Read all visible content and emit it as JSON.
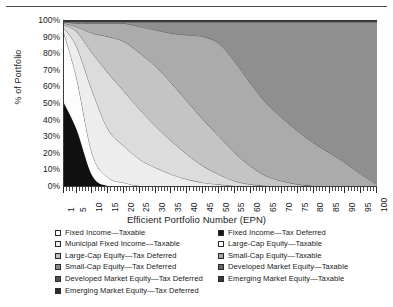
{
  "chart_data": {
    "type": "area",
    "stacked": true,
    "title": "",
    "xlabel": "Efficient Portfolio Number (EPN)",
    "ylabel": "% of Portfolio",
    "xlim": [
      1,
      100
    ],
    "ylim": [
      0,
      100
    ],
    "grid": false,
    "legend_position": "bottom",
    "y_ticks": [
      "0%",
      "10%",
      "20%",
      "30%",
      "40%",
      "50%",
      "60%",
      "70%",
      "80%",
      "90%",
      "100%"
    ],
    "y_tick_values": [
      0,
      10,
      20,
      30,
      40,
      50,
      60,
      70,
      80,
      90,
      100
    ],
    "x_ticks": [
      "1",
      "5",
      "10",
      "15",
      "20",
      "25",
      "30",
      "35",
      "40",
      "45",
      "50",
      "55",
      "60",
      "65",
      "70",
      "75",
      "80",
      "85",
      "90",
      "95",
      "100"
    ],
    "x_tick_values": [
      1,
      5,
      10,
      15,
      20,
      25,
      30,
      35,
      40,
      45,
      50,
      55,
      60,
      65,
      70,
      75,
      80,
      85,
      90,
      95,
      100
    ],
    "x": [
      1,
      5,
      10,
      15,
      20,
      25,
      30,
      35,
      40,
      45,
      50,
      55,
      60,
      65,
      70,
      75,
      80,
      85,
      90,
      95,
      100
    ],
    "series": [
      {
        "name": "Fixed Income—Tax Deferred",
        "color": "#111111",
        "values": [
          50,
          34,
          6,
          0,
          0,
          0,
          0,
          0,
          0,
          0,
          0,
          0,
          0,
          0,
          0,
          0,
          0,
          0,
          0,
          0,
          0
        ]
      },
      {
        "name": "Fixed Income—Taxable",
        "color": "#fdfdfd",
        "values": [
          42,
          31,
          13,
          5,
          2,
          0,
          0,
          0,
          0,
          0,
          0,
          0,
          0,
          0,
          0,
          0,
          0,
          0,
          0,
          0,
          0
        ]
      },
      {
        "name": "Municipal Fixed Income—Taxable",
        "color": "#ededed",
        "values": [
          3,
          19,
          38,
          29,
          22,
          16,
          11,
          7,
          4,
          2,
          1,
          0,
          0,
          0,
          0,
          0,
          0,
          0,
          0,
          0,
          0
        ]
      },
      {
        "name": "Large-Cap Equity—Taxable",
        "color": "#dcdcdc",
        "values": [
          2,
          9,
          23,
          34,
          33,
          30,
          25,
          20,
          15,
          10,
          6,
          3,
          1,
          0,
          0,
          0,
          0,
          0,
          0,
          0,
          0
        ]
      },
      {
        "name": "Large-Cap Equity—Tax Deferred",
        "color": "#c4c4c4",
        "values": [
          1,
          3,
          12,
          22,
          30,
          34,
          36,
          35,
          32,
          28,
          23,
          17,
          11,
          6,
          3,
          1,
          0,
          0,
          0,
          0,
          0
        ]
      },
      {
        "name": "Small-Cap Equity—Taxable",
        "color": "#ababab",
        "values": [
          1,
          2,
          6,
          8,
          11,
          16,
          22,
          30,
          40,
          50,
          56,
          55,
          50,
          44,
          38,
          32,
          26,
          20,
          14,
          7,
          1
        ]
      },
      {
        "name": "Small-Cap Equity—Tax Deferred",
        "color": "#8f8f8f",
        "values": [
          0,
          1,
          1,
          1,
          1,
          3,
          5,
          7,
          8,
          9,
          13,
          24,
          37,
          49,
          58,
          66,
          73,
          79,
          85,
          92,
          98
        ]
      },
      {
        "name": "Developed Market Equity—Taxable",
        "color": "#6e6e6e",
        "values": [
          0,
          0,
          0,
          0,
          0,
          0,
          0,
          0,
          0,
          0,
          0,
          0,
          0,
          0,
          0,
          0,
          0,
          0,
          0,
          0,
          0
        ]
      },
      {
        "name": "Developed Market Equity—Tax Deferred",
        "color": "#565656",
        "values": [
          0,
          0,
          0,
          0,
          0,
          0,
          0,
          0,
          0,
          0,
          0,
          0,
          0,
          0,
          0,
          0,
          0,
          0,
          0,
          0,
          0
        ]
      },
      {
        "name": "Emerging Market Equity—Taxable",
        "color": "#3d3d3d",
        "values": [
          1,
          1,
          1,
          1,
          1,
          1,
          1,
          1,
          1,
          1,
          1,
          1,
          1,
          1,
          1,
          1,
          1,
          1,
          1,
          1,
          1
        ]
      },
      {
        "name": "Emerging Market Equity—Tax Deferred",
        "color": "#2a2a2a",
        "values": [
          0,
          0,
          0,
          0,
          0,
          0,
          0,
          0,
          0,
          0,
          0,
          0,
          0,
          0,
          0,
          0,
          0,
          0,
          0,
          0,
          0
        ]
      }
    ]
  },
  "axes": {
    "ylabel": "% of Portfolio",
    "xtitle": "Efficient Portfolio Number (EPN)"
  },
  "legend": {
    "column_left": [
      {
        "label": "Fixed Income—Taxable",
        "swatch": "#ffffff"
      },
      {
        "label": "Municipal Fixed Income—Taxable",
        "swatch": "#f0f0f0"
      },
      {
        "label": "Large-Cap Equity—Tax Deferred",
        "swatch": "#bdbdbd"
      },
      {
        "label": "Small-Cap Equity—Tax Deferred",
        "swatch": "#8a8a8a"
      },
      {
        "label": "Developed Market Equity—Tax Deferred",
        "swatch": "#4f4f4f"
      },
      {
        "label": "Emerging Market Equity—Tax Deferred",
        "swatch": "#2b2b2b"
      }
    ],
    "column_right": [
      {
        "label": "Fixed Income—Tax Deferred",
        "swatch": "#151515"
      },
      {
        "label": "Large-Cap Equity—Taxable",
        "swatch": "#ffffff"
      },
      {
        "label": "Small-Cap Equity—Taxable",
        "swatch": "#a6a6a6"
      },
      {
        "label": "Developed Market Equity—Taxable",
        "swatch": "#636363"
      },
      {
        "label": "Emerging Market Equity—Taxable",
        "swatch": "#3a3a3a"
      }
    ]
  }
}
